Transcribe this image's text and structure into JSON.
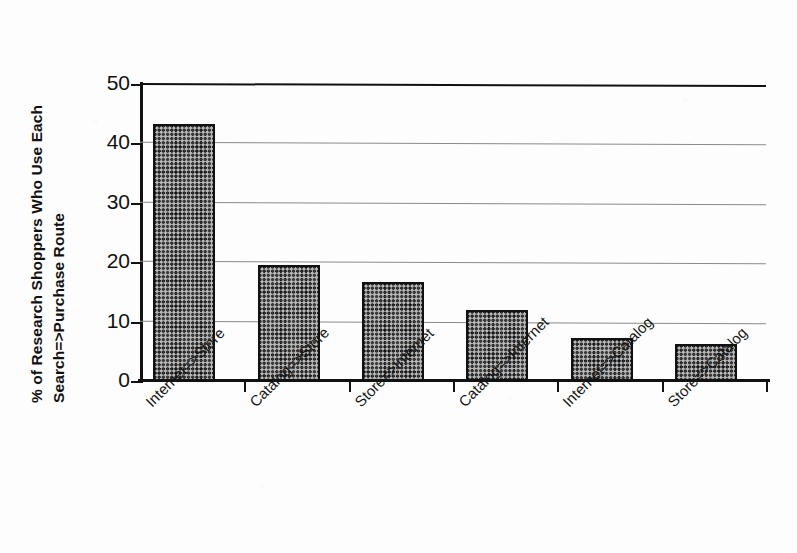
{
  "chart_data": {
    "type": "bar",
    "title": "",
    "subtitle": "",
    "xlabel": "",
    "ylabel": "% of Research Shoppers Who Use Each Search=>Purchase Route",
    "ylabel_lines": [
      "% of Research Shoppers Who Use Each",
      "Search=>Purchase Route"
    ],
    "categories": [
      "Internet=>Store",
      "Catalog=>Store",
      "Store=>Internet",
      "Catalog=>Internet",
      "Internet=>Catalog",
      "Store=>Catalog"
    ],
    "values": [
      43.3,
      19.5,
      16.6,
      11.9,
      7.2,
      6.2
    ],
    "ylim": [
      0,
      50
    ],
    "ytick_labels": [
      "0",
      "10",
      "20",
      "30",
      "40",
      "50"
    ],
    "ytick_values": [
      0,
      10,
      20,
      30,
      40,
      50
    ],
    "grid": "horizontal",
    "legend": "none",
    "bar_fill": "crosshatch-pattern",
    "colors": {
      "bar_fill": "#b9b9b9",
      "bar_pattern": "#121212",
      "bar_border": "#111111",
      "axis": "#111111",
      "gridline": "#8a8a8a",
      "background": "#ffffff",
      "text": "#111111"
    }
  }
}
